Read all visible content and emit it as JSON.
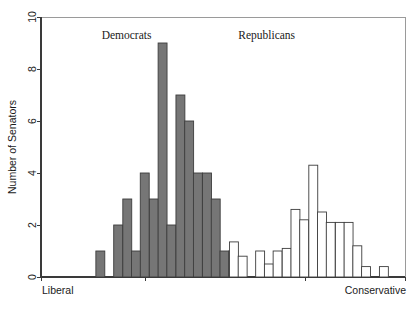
{
  "chart_data": {
    "type": "bar",
    "title": "",
    "subtitle": "",
    "xlabel": "",
    "ylabel": "Number of Senators",
    "ylim": [
      0,
      10
    ],
    "yticks": [
      0,
      2,
      4,
      6,
      8,
      10
    ],
    "ytick_labels": [
      "0",
      "2",
      "4",
      "6",
      "8",
      "10"
    ],
    "xlim": [
      0,
      100
    ],
    "xtick_labels": [
      "Liberal",
      "Conservative"
    ],
    "xtick_left_label": "Liberal",
    "xtick_right_label": "Conservative",
    "grid": false,
    "legend_position": "none",
    "annotations": [
      {
        "text": "Democrats",
        "x": 23.5,
        "y": 9.9
      },
      {
        "text": "Republicans",
        "x": 62.0,
        "y": 9.9
      }
    ],
    "series": [
      {
        "name": "Democrats",
        "color": "#767676",
        "fill": "#767676",
        "edge": "#3d3d3d",
        "bar_width": 2.45,
        "x": [
          16.3,
          21.2,
          23.7,
          26.1,
          28.5,
          31.0,
          33.4,
          35.8,
          38.3,
          40.7,
          43.1,
          45.6,
          48.0,
          50.4,
          52.8
        ],
        "values": [
          1,
          2,
          3,
          1,
          4,
          3,
          9,
          2,
          7,
          6,
          4,
          4,
          3,
          1,
          1
        ]
      },
      {
        "name": "Republicans",
        "color": "#ffffff",
        "fill": "#ffffff",
        "edge": "#3d3d3d",
        "bar_width": 2.45,
        "x": [
          53.0,
          55.4,
          60.2,
          62.6,
          65.0,
          67.5,
          69.9,
          72.3,
          74.8,
          77.2,
          79.6,
          82.1,
          84.5,
          86.9,
          89.3,
          94.2
        ],
        "values": [
          1.35,
          0.8,
          1.0,
          0.5,
          1.0,
          1.1,
          2.6,
          2.2,
          4.3,
          2.5,
          2.1,
          2.1,
          2.1,
          1.2,
          0.4,
          0.4
        ],
        "highlight_index": 0,
        "highlight_fill": "#767676"
      }
    ]
  },
  "axes": {
    "y_title": "Number of Senators",
    "x_left_label": "Liberal",
    "x_right_label": "Conservative"
  },
  "labels": {
    "democrats": "Democrats",
    "republicans": "Republicans"
  }
}
